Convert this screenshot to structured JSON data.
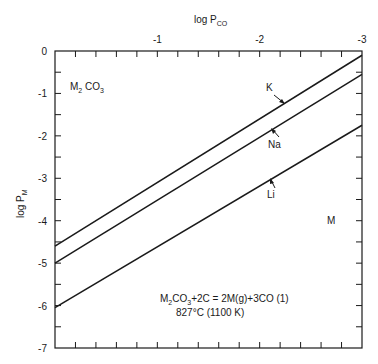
{
  "chart_data": {
    "type": "line",
    "title": "",
    "xlabel": "log P",
    "xlabel_sub": "CO",
    "ylabel": "log P",
    "ylabel_sub": "M",
    "xaxis_position": "top",
    "xlim": [
      0,
      -3
    ],
    "ylim": [
      -7,
      0
    ],
    "xticks": [
      -1,
      -2,
      -3
    ],
    "xtick_labels": [
      "-1",
      "-2",
      "-3"
    ],
    "xminor_per_unit": 5,
    "yticks": [
      0,
      -1,
      -2,
      -3,
      -4,
      -5,
      -6,
      -7
    ],
    "ytick_labels": [
      "0",
      "-1",
      "-2",
      "-3",
      "-4",
      "-5",
      "-6",
      "-7"
    ],
    "grid": false,
    "series": [
      {
        "name": "K",
        "x": [
          0,
          -3
        ],
        "y": [
          -4.6,
          -0.1
        ]
      },
      {
        "name": "Na",
        "x": [
          0,
          -3
        ],
        "y": [
          -5.0,
          -0.55
        ]
      },
      {
        "name": "Li",
        "x": [
          0,
          -3
        ],
        "y": [
          -6.05,
          -1.75
        ]
      }
    ],
    "annotations": {
      "region_top_left": {
        "main": "M",
        "sub1": "2",
        "rest": " CO",
        "sub2": "3"
      },
      "region_bottom_right": "M",
      "equation": {
        "p1": "M",
        "s1": "2",
        "p2": "CO",
        "s2": "3",
        "p3": "+2C = 2M(g)+3CO    (1)"
      },
      "condition": "827°C (1100 K)"
    },
    "line_labels": [
      {
        "series": "K",
        "label": "K"
      },
      {
        "series": "Na",
        "label": "Na"
      },
      {
        "series": "Li",
        "label": "Li"
      }
    ]
  }
}
